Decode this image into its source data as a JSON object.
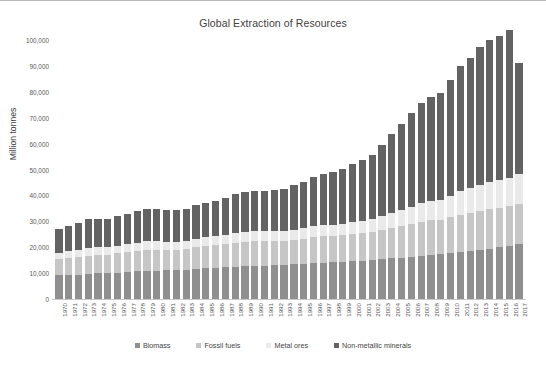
{
  "chart_data": {
    "type": "bar",
    "subtype": "stacked-bar",
    "title": "Global Extraction of Resources",
    "xlabel": "",
    "ylabel": "Million tonnes",
    "ylim": [
      0,
      100000
    ],
    "ytick_step": 10000,
    "ytick_labels": [
      "0",
      "10,000",
      "20,000",
      "30,000",
      "40,000",
      "50,000",
      "60,000",
      "70,000",
      "80,000",
      "90,000",
      "100,000"
    ],
    "ytick_values": [
      0,
      10000,
      20000,
      30000,
      40000,
      50000,
      60000,
      70000,
      80000,
      90000,
      100000
    ],
    "grid": false,
    "legend_position": "bottom",
    "categories": [
      "1970",
      "1971",
      "1972",
      "1973",
      "1974",
      "1975",
      "1976",
      "1977",
      "1978",
      "1979",
      "1980",
      "1981",
      "1982",
      "1983",
      "1984",
      "1985",
      "1986",
      "1987",
      "1988",
      "1989",
      "1990",
      "1991",
      "1992",
      "1993",
      "1994",
      "1995",
      "1996",
      "1997",
      "1998",
      "1999",
      "2000",
      "2001",
      "2002",
      "2003",
      "2004",
      "2005",
      "2006",
      "2007",
      "2008",
      "2009",
      "2010",
      "2011",
      "2012",
      "2013",
      "2014",
      "2015",
      "2016",
      "2017"
    ],
    "series": [
      {
        "name": "Biomass",
        "color": "#8f8f8f",
        "values": [
          9100,
          9300,
          9450,
          9700,
          9900,
          10050,
          10200,
          10400,
          10650,
          10800,
          10950,
          11050,
          11200,
          11300,
          11600,
          11800,
          12000,
          12200,
          12450,
          12650,
          12800,
          12900,
          13050,
          13150,
          13400,
          13650,
          13900,
          14050,
          14200,
          14400,
          14600,
          14800,
          15000,
          15300,
          15650,
          15950,
          16300,
          16600,
          17000,
          17200,
          17600,
          18000,
          18400,
          18900,
          19400,
          19900,
          20600,
          21300
        ]
      },
      {
        "name": "Fossil fuels",
        "color": "#c6c6c6",
        "values": [
          6200,
          6500,
          6750,
          7100,
          7050,
          7050,
          7400,
          7650,
          7800,
          8150,
          8100,
          7950,
          7900,
          7950,
          8300,
          8550,
          8700,
          8900,
          9200,
          9400,
          9450,
          9400,
          9350,
          9350,
          9450,
          9650,
          9950,
          10100,
          10150,
          10200,
          10500,
          10700,
          10850,
          11400,
          11950,
          12400,
          12800,
          13200,
          13500,
          13350,
          14000,
          14600,
          14900,
          15100,
          15200,
          15150,
          15200,
          15500
        ]
      },
      {
        "name": "Metal ores",
        "color": "#eaeaea",
        "values": [
          2600,
          2700,
          2800,
          3000,
          3000,
          2900,
          3000,
          3100,
          3200,
          3350,
          3300,
          3200,
          3100,
          3150,
          3350,
          3450,
          3500,
          3600,
          3800,
          3900,
          3900,
          3850,
          3800,
          3800,
          3900,
          4050,
          4200,
          4350,
          4400,
          4500,
          4700,
          4800,
          4950,
          5300,
          5750,
          6150,
          6600,
          7100,
          7400,
          7500,
          8300,
          9000,
          9500,
          10100,
          10600,
          10800,
          11000,
          11300
        ]
      },
      {
        "name": "Non-metallic minerals",
        "color": "#636363",
        "values": [
          9300,
          9700,
          10200,
          11000,
          10900,
          10800,
          11300,
          11700,
          12200,
          12600,
          12500,
          12300,
          12200,
          12400,
          12900,
          13300,
          13800,
          14300,
          15000,
          15500,
          15700,
          15700,
          15900,
          16300,
          17100,
          17900,
          18900,
          19800,
          20400,
          21200,
          22400,
          23500,
          25000,
          27500,
          30400,
          33200,
          36100,
          38900,
          40100,
          41400,
          44600,
          48200,
          50400,
          53100,
          55000,
          55600,
          56900,
          43000
        ]
      }
    ],
    "legend": [
      {
        "label": "Biomass",
        "color": "#8f8f8f"
      },
      {
        "label": "Fossil fuels",
        "color": "#c6c6c6"
      },
      {
        "label": "Metal ores",
        "color": "#eaeaea"
      },
      {
        "label": "Non-metallic minerals",
        "color": "#636363"
      }
    ],
    "source_note": ""
  }
}
